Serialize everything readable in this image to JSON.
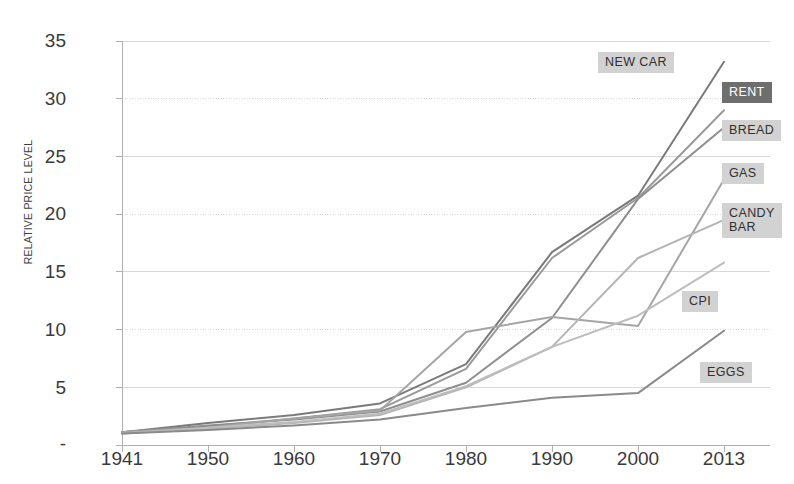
{
  "chart_data": {
    "type": "line",
    "title": "",
    "xlabel": "",
    "ylabel": "RELATIVE PRICE LEVEL",
    "x": [
      "1941",
      "1950",
      "1960",
      "1970",
      "1980",
      "1990",
      "2000",
      "2013"
    ],
    "xtick_labels": [
      "1941",
      "1950",
      "1960",
      "1970",
      "1980",
      "1990",
      "2000",
      "2013"
    ],
    "ytick_labels": [
      "35",
      "30",
      "25",
      "20",
      "15",
      "10",
      "5",
      "-"
    ],
    "ytick_values": [
      35,
      30,
      25,
      20,
      15,
      10,
      5,
      0
    ],
    "ylim": [
      0,
      35
    ],
    "grid": true,
    "legend_position": "right-inline-labels",
    "series": [
      {
        "name": "NEW CAR",
        "color": "#7a7a7a",
        "label_style": "light",
        "values": [
          1.1,
          1.9,
          2.6,
          3.6,
          7.0,
          16.7,
          21.6,
          33.2
        ]
      },
      {
        "name": "RENT",
        "color": "#9a9a9a",
        "label_style": "dark",
        "values": [
          1.1,
          1.6,
          2.3,
          3.1,
          6.6,
          16.2,
          21.4,
          29.0
        ]
      },
      {
        "name": "BREAD",
        "color": "#8e8e8e",
        "label_style": "light",
        "values": [
          1.1,
          1.7,
          2.2,
          2.9,
          5.4,
          11.0,
          21.3,
          27.5
        ]
      },
      {
        "name": "GAS",
        "color": "#a5a5a5",
        "label_style": "light",
        "values": [
          1.1,
          1.5,
          2.3,
          3.0,
          9.8,
          11.1,
          10.3,
          23.0
        ]
      },
      {
        "name": "CANDY BAR",
        "color": "#b4b4b4",
        "label_style": "light",
        "values": [
          1.0,
          1.4,
          1.9,
          2.6,
          5.0,
          8.5,
          16.2,
          19.5
        ]
      },
      {
        "name": "CPI",
        "color": "#bdbdbd",
        "label_style": "light",
        "values": [
          1.0,
          1.5,
          2.0,
          2.7,
          5.1,
          8.5,
          11.2,
          15.8
        ]
      },
      {
        "name": "EGGS",
        "color": "#8a8a8a",
        "label_style": "light",
        "values": [
          1.0,
          1.3,
          1.7,
          2.2,
          3.2,
          4.1,
          4.5,
          9.9
        ]
      }
    ]
  },
  "labels": {
    "new_car": "NEW CAR",
    "rent": "RENT",
    "bread": "BREAD",
    "gas": "GAS",
    "candy_bar": "CANDY\nBAR",
    "cpi": "CPI",
    "eggs": "EGGS"
  },
  "axis": {
    "y_title": "RELATIVE PRICE LEVEL",
    "y_35": "35",
    "y_30": "30",
    "y_25": "25",
    "y_20": "20",
    "y_15": "15",
    "y_10": "10",
    "y_5": "5",
    "y_0": "-",
    "x_1941": "1941",
    "x_1950": "1950",
    "x_1960": "1960",
    "x_1970": "1970",
    "x_1980": "1980",
    "x_1990": "1990",
    "x_2000": "2000",
    "x_2013": "2013"
  },
  "colors": {
    "grid": "#d8d8d8",
    "axis": "#b0b0b0",
    "text": "#3a3a3a",
    "chip_light": "#d2d2d2",
    "chip_dark": "#6e6e6e"
  }
}
